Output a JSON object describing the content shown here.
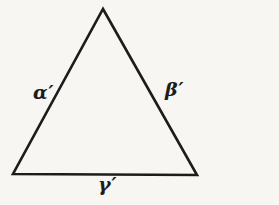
{
  "figure": {
    "type": "geometry-diagram",
    "background_color": "#f7f6f3",
    "line_color": "#1c1c1c",
    "labels": {
      "left_side": "α′",
      "right_side": "β′",
      "base": "γ′"
    }
  }
}
